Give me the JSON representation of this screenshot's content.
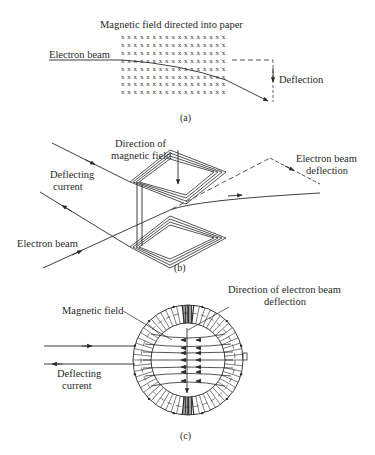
{
  "panel_a": {
    "caption": "(a)",
    "title": "Magnetic field directed into paper",
    "beam_label": "Electron beam",
    "deflection_label": "Deflection",
    "field_marker": "x",
    "field_grid": {
      "rows": 8,
      "cols": 17
    }
  },
  "panel_b": {
    "caption": "(b)",
    "field_label_line1": "Direction of",
    "field_label_line2": "magnetic field",
    "current_label_line1": "Deflecting",
    "current_label_line2": "current",
    "beam_label": "Electron beam",
    "deflection_label_line1": "Electron beam",
    "deflection_label_line2": "deflection"
  },
  "panel_c": {
    "caption": "(c)",
    "field_label": "Magnetic field",
    "deflection_label_line1": "Direction of electron beam",
    "deflection_label_line2": "deflection",
    "current_label_line1": "Deflecting",
    "current_label_line2": "current"
  },
  "colors": {
    "ink": "#2a2a2a",
    "background": "#ffffff"
  }
}
